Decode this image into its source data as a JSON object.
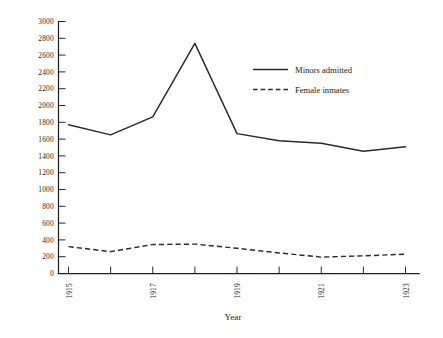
{
  "chart_data": {
    "type": "line",
    "title": "",
    "subtitle": "",
    "xlabel": "Year",
    "ylabel": "",
    "x": [
      1915,
      1916,
      1917,
      1918,
      1919,
      1920,
      1921,
      1922,
      1923
    ],
    "categories": [
      "1915",
      "1916",
      "1917",
      "1918",
      "1919",
      "1920",
      "1921",
      "1922",
      "1923"
    ],
    "series": [
      {
        "name": "Minors admitted",
        "style": "solid",
        "color": "#2a2a2a",
        "values": [
          1770,
          1650,
          1865,
          2740,
          1665,
          1580,
          1550,
          1455,
          1510
        ]
      },
      {
        "name": "Female inmates",
        "style": "dashed",
        "color": "#2a2a2a",
        "values": [
          320,
          260,
          345,
          350,
          300,
          245,
          195,
          210,
          230
        ]
      }
    ],
    "xlim": [
      1915,
      1923
    ],
    "ylim": [
      0,
      3000
    ],
    "yticks": [
      0,
      200,
      400,
      600,
      800,
      1000,
      1200,
      1400,
      1600,
      1800,
      2000,
      2200,
      2400,
      2600,
      2800,
      3000
    ],
    "ytick_labels": [
      "0",
      "200",
      "400",
      "600",
      "800",
      "1000",
      "1200",
      "1400",
      "1600",
      "1800",
      "2000",
      "2200",
      "2400",
      "2600",
      "2800",
      "3000"
    ],
    "xticks": [
      1915,
      1916,
      1917,
      1918,
      1919,
      1920,
      1921,
      1922,
      1923
    ],
    "xtick_labels": [
      "1915",
      "",
      "1917",
      "",
      "1919",
      "",
      "1921",
      "",
      "1923"
    ],
    "xtick_label_rotation": -90,
    "grid": false,
    "legend_position": "upper right inside",
    "legend_entries": [
      "Minors admitted",
      "Female inmates"
    ]
  },
  "axes": {
    "x_axis_title": "Year",
    "y_axis_title": ""
  },
  "legend": {
    "items": [
      {
        "label": "Minors admitted",
        "style": "solid"
      },
      {
        "label": "Female inmates",
        "style": "dashed"
      }
    ]
  }
}
